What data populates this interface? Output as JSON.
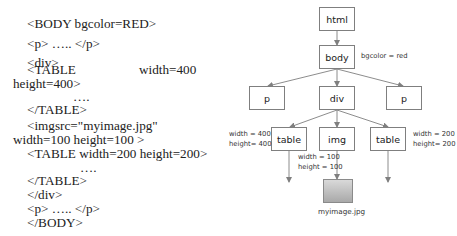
{
  "code": {
    "lines": [
      "<BODY bgcolor=RED>",
      "<p> ….. </p>",
      "<div>",
      "<TABLE",
      "width=400",
      "height=400>",
      "….",
      "</TABLE>",
      "<imgsrc=\"myimage.jpg\"",
      "width=100 height=100 >",
      "<TABLE width=200 height=200>",
      "….",
      "</TABLE>",
      "</div>",
      "<p> ….. </p>",
      "</BODY>"
    ]
  },
  "tree": {
    "nodes": {
      "html": "html",
      "body": "body",
      "p_left": "p",
      "div": "div",
      "p_right": "p",
      "table_left": "table",
      "img": "img",
      "table_right": "table"
    },
    "annotations": {
      "body": "bgcolor = red",
      "table_left": "width = 400\nheight= 400",
      "img": "width = 100\nheight = 100",
      "table_right": "width = 200\nheight= 200"
    },
    "image_caption": "myimage.jpg"
  },
  "colors": {
    "border": "#7f7f7f",
    "edge": "#7f7f7f",
    "text": "#222222"
  }
}
